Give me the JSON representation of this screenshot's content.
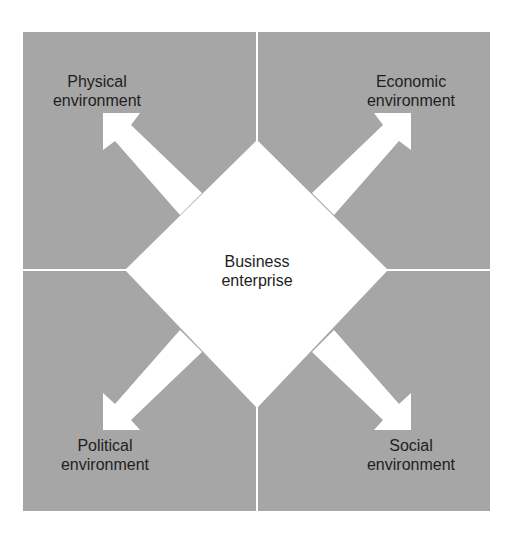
{
  "diagram": {
    "colors": {
      "panel": "#a6a6a6",
      "divider": "#ffffff",
      "arrow": "#ffffff",
      "text": "#1e1e1e"
    },
    "center": {
      "line1": "Business",
      "line2": "enterprise"
    },
    "quadrants": [
      {
        "id": "physical",
        "line1": "Physical",
        "line2": "environment",
        "position": "top-left"
      },
      {
        "id": "economic",
        "line1": "Economic",
        "line2": "environment",
        "position": "top-right"
      },
      {
        "id": "political",
        "line1": "Political",
        "line2": "environment",
        "position": "bottom-left"
      },
      {
        "id": "social",
        "line1": "Social",
        "line2": "environment",
        "position": "bottom-right"
      }
    ]
  }
}
